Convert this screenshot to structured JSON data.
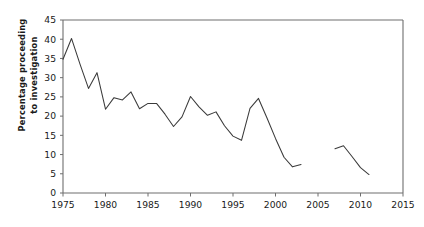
{
  "chart_data": {
    "type": "line",
    "title": "",
    "xlabel": "",
    "ylabel": "Percentage  proceeding to investigation",
    "ylabel_line1": "Percentage  proceeding",
    "ylabel_line2": "to investigation",
    "xlim": [
      1975,
      2015
    ],
    "ylim": [
      0,
      45
    ],
    "xticks": [
      1975,
      1980,
      1985,
      1990,
      1995,
      2000,
      2005,
      2010,
      2015
    ],
    "yticks": [
      0,
      5,
      10,
      15,
      20,
      25,
      30,
      35,
      40,
      45
    ],
    "xtick_labels": [
      "1975",
      "1980",
      "1985",
      "1990",
      "1995",
      "2000",
      "2005",
      "2010",
      "2015"
    ],
    "ytick_labels": [
      "0",
      "5",
      "10",
      "15",
      "20",
      "25",
      "30",
      "35",
      "40",
      "45"
    ],
    "grid": false,
    "legend": "none",
    "line_color": "#3a3a3a",
    "axis_color": "#6e6e6e",
    "series": [
      {
        "name": "Percentage proceeding to investigation (1975-2003)",
        "x": [
          1975,
          1976,
          1977,
          1978,
          1979,
          1980,
          1981,
          1982,
          1983,
          1984,
          1985,
          1986,
          1987,
          1988,
          1989,
          1990,
          1991,
          1992,
          1993,
          1994,
          1995,
          1996,
          1997,
          1998,
          1999,
          2000,
          2001,
          2002,
          2003
        ],
        "values": [
          34.8,
          40.2,
          33.5,
          27.2,
          31.3,
          21.8,
          24.8,
          24.2,
          26.3,
          21.9,
          23.3,
          23.3,
          20.5,
          17.3,
          19.8,
          25.1,
          22.4,
          20.2,
          21.1,
          17.5,
          14.8,
          13.7,
          22.0,
          24.6,
          19.5,
          14.2,
          9.3,
          6.8,
          7.4
        ]
      },
      {
        "name": "Percentage proceeding to investigation (2007-2011)",
        "x": [
          2007,
          2008,
          2009,
          2010,
          2011
        ],
        "values": [
          11.5,
          12.3,
          9.5,
          6.6,
          4.8
        ]
      }
    ]
  },
  "axes": {
    "plot_left_px": 63,
    "plot_right_px": 403,
    "plot_top_px": 20,
    "plot_bottom_px": 193
  }
}
